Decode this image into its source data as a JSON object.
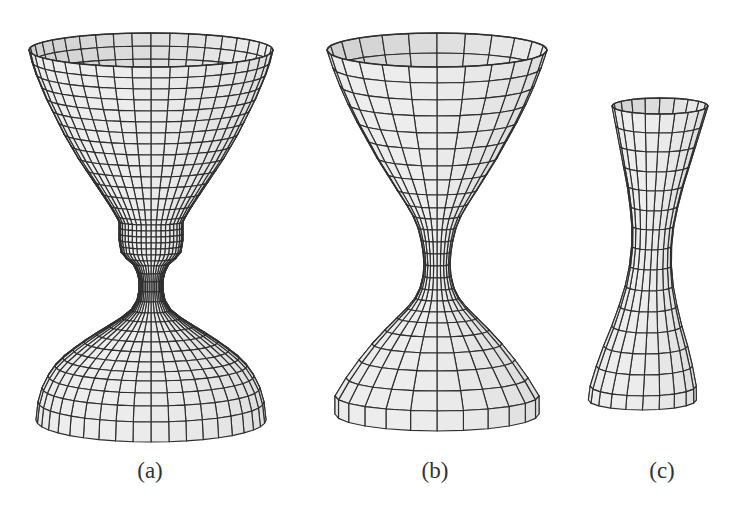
{
  "figure": {
    "background": "#ffffff",
    "line_color": "#2e2e2e",
    "face_color": "#ececec",
    "shade_colors": [
      "#d8d8d8",
      "#a9a9a9",
      "#8a8a8a",
      "#727272"
    ]
  },
  "panels": [
    {
      "id": "a",
      "label": "(a)",
      "label_x": 150,
      "description": "wireframe surface of revolution: wide cup, short cylindrical collar, narrow neck, flared bell base",
      "cx": 151,
      "meridians": 40,
      "profile": [
        {
          "y": 50,
          "r": 122,
          "ry": 17
        },
        {
          "y": 62,
          "r": 119,
          "ry": 16
        },
        {
          "y": 74,
          "r": 115,
          "ry": 15
        },
        {
          "y": 86,
          "r": 110,
          "ry": 14
        },
        {
          "y": 98,
          "r": 105,
          "ry": 13
        },
        {
          "y": 110,
          "r": 99,
          "ry": 12
        },
        {
          "y": 122,
          "r": 93,
          "ry": 11
        },
        {
          "y": 134,
          "r": 87,
          "ry": 10
        },
        {
          "y": 146,
          "r": 80,
          "ry": 9
        },
        {
          "y": 158,
          "r": 73,
          "ry": 8
        },
        {
          "y": 170,
          "r": 65,
          "ry": 7
        },
        {
          "y": 182,
          "r": 57,
          "ry": 6
        },
        {
          "y": 194,
          "r": 49,
          "ry": 5
        },
        {
          "y": 206,
          "r": 41,
          "ry": 4
        },
        {
          "y": 216,
          "r": 35,
          "ry": 4
        },
        {
          "y": 222,
          "r": 32,
          "ry": 3
        },
        {
          "y": 228,
          "r": 32,
          "ry": 3
        },
        {
          "y": 234,
          "r": 32,
          "ry": 3
        },
        {
          "y": 240,
          "r": 32,
          "ry": 3
        },
        {
          "y": 246,
          "r": 31,
          "ry": 3
        },
        {
          "y": 252,
          "r": 30,
          "ry": 3
        },
        {
          "y": 258,
          "r": 25,
          "ry": 3
        },
        {
          "y": 264,
          "r": 18,
          "ry": 2
        },
        {
          "y": 272,
          "r": 14,
          "ry": 2
        },
        {
          "y": 280,
          "r": 12,
          "ry": 2
        },
        {
          "y": 290,
          "r": 12,
          "ry": 2
        },
        {
          "y": 300,
          "r": 14,
          "ry": 2
        },
        {
          "y": 310,
          "r": 20,
          "ry": 3
        },
        {
          "y": 318,
          "r": 30,
          "ry": 4
        },
        {
          "y": 326,
          "r": 42,
          "ry": 6
        },
        {
          "y": 334,
          "r": 55,
          "ry": 8
        },
        {
          "y": 342,
          "r": 67,
          "ry": 10
        },
        {
          "y": 350,
          "r": 78,
          "ry": 12
        },
        {
          "y": 358,
          "r": 88,
          "ry": 14
        },
        {
          "y": 366,
          "r": 96,
          "ry": 15
        },
        {
          "y": 376,
          "r": 103,
          "ry": 17
        },
        {
          "y": 388,
          "r": 109,
          "ry": 18
        },
        {
          "y": 402,
          "r": 113,
          "ry": 20
        },
        {
          "y": 420,
          "r": 115,
          "ry": 22
        }
      ],
      "shaded_band": {
        "from_ring": 36,
        "meridian_from": 24,
        "meridian_to": 31
      }
    },
    {
      "id": "b",
      "label": "(b)",
      "label_x": 435,
      "description": "wireframe surface of revolution: hourglass with wide conical cup and conical base",
      "cx": 437,
      "meridians": 24,
      "profile": [
        {
          "y": 50,
          "r": 110,
          "ry": 17
        },
        {
          "y": 68,
          "r": 104,
          "ry": 15
        },
        {
          "y": 86,
          "r": 97,
          "ry": 14
        },
        {
          "y": 104,
          "r": 89,
          "ry": 12
        },
        {
          "y": 122,
          "r": 80,
          "ry": 11
        },
        {
          "y": 140,
          "r": 70,
          "ry": 9
        },
        {
          "y": 158,
          "r": 60,
          "ry": 8
        },
        {
          "y": 174,
          "r": 50,
          "ry": 6
        },
        {
          "y": 190,
          "r": 40,
          "ry": 5
        },
        {
          "y": 204,
          "r": 31,
          "ry": 4
        },
        {
          "y": 216,
          "r": 24,
          "ry": 3
        },
        {
          "y": 228,
          "r": 19,
          "ry": 2
        },
        {
          "y": 240,
          "r": 16,
          "ry": 2
        },
        {
          "y": 252,
          "r": 14,
          "ry": 2
        },
        {
          "y": 264,
          "r": 13,
          "ry": 2
        },
        {
          "y": 276,
          "r": 14,
          "ry": 2
        },
        {
          "y": 288,
          "r": 17,
          "ry": 2
        },
        {
          "y": 298,
          "r": 22,
          "ry": 3
        },
        {
          "y": 308,
          "r": 30,
          "ry": 4
        },
        {
          "y": 318,
          "r": 40,
          "ry": 5
        },
        {
          "y": 330,
          "r": 52,
          "ry": 7
        },
        {
          "y": 344,
          "r": 65,
          "ry": 9
        },
        {
          "y": 360,
          "r": 78,
          "ry": 11
        },
        {
          "y": 378,
          "r": 91,
          "ry": 13
        },
        {
          "y": 396,
          "r": 102,
          "ry": 15
        },
        {
          "y": 414,
          "r": 102,
          "ry": 17
        }
      ],
      "shaded_band": null
    },
    {
      "id": "c",
      "label": "(c)",
      "label_x": 662,
      "description": "wireframe surface of revolution: narrow tilted hyperboloid with shaded lower band",
      "cx": 660,
      "meridians": 20,
      "tilt": 0.06,
      "profile": [
        {
          "y": 106,
          "r": 48,
          "ry": 8
        },
        {
          "y": 126,
          "r": 43,
          "ry": 7
        },
        {
          "y": 146,
          "r": 38,
          "ry": 6
        },
        {
          "y": 166,
          "r": 33,
          "ry": 6
        },
        {
          "y": 186,
          "r": 28,
          "ry": 5
        },
        {
          "y": 206,
          "r": 24,
          "ry": 5
        },
        {
          "y": 226,
          "r": 21,
          "ry": 4
        },
        {
          "y": 246,
          "r": 20,
          "ry": 4
        },
        {
          "y": 266,
          "r": 21,
          "ry": 4
        },
        {
          "y": 286,
          "r": 24,
          "ry": 5
        },
        {
          "y": 306,
          "r": 29,
          "ry": 6
        },
        {
          "y": 326,
          "r": 35,
          "ry": 7
        },
        {
          "y": 346,
          "r": 42,
          "ry": 8
        },
        {
          "y": 366,
          "r": 48,
          "ry": 9
        },
        {
          "y": 386,
          "r": 53,
          "ry": 10
        },
        {
          "y": 400,
          "r": 54,
          "ry": 10
        }
      ],
      "shaded_band": {
        "from_ring": 8,
        "meridian_from": 11,
        "meridian_to": 15
      }
    }
  ]
}
